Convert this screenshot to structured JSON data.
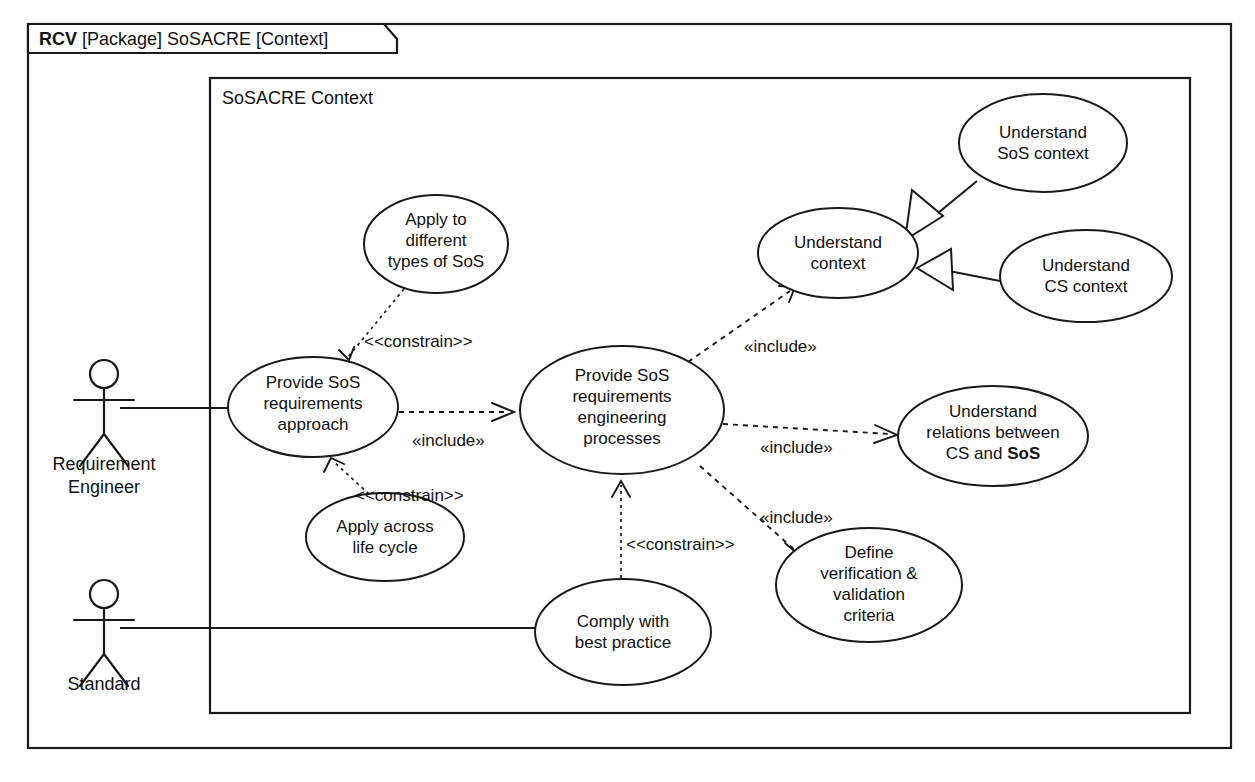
{
  "frame": {
    "kind": "RCV",
    "rest": " [Package] SoSACRE [Context]",
    "full_title": "RCV [Package] SoSACRE [Context]"
  },
  "inner_box": {
    "label": "SoSACRE Context"
  },
  "actors": [
    {
      "id": "requirement-engineer",
      "name_lines": [
        "Requirement",
        "Engineer"
      ],
      "cx": 104,
      "head_cy": 374,
      "label_y1": 470,
      "label_y2": 493
    },
    {
      "id": "standard",
      "name_lines": [
        "Standard"
      ],
      "cx": 104,
      "head_cy": 594,
      "label_y1": 690,
      "label_y2": null
    }
  ],
  "use_cases": [
    {
      "id": "apply-different-types-sos",
      "lines": [
        "Apply to",
        "different",
        "types of SoS"
      ],
      "cx": 436,
      "cy": 244,
      "rx": 72,
      "ry": 49
    },
    {
      "id": "understand-context",
      "lines": [
        "Understand",
        "context"
      ],
      "cx": 838,
      "cy": 253,
      "rx": 80,
      "ry": 45
    },
    {
      "id": "understand-sos-context",
      "lines": [
        "Understand",
        "SoS context"
      ],
      "cx": 1043,
      "cy": 143,
      "rx": 84,
      "ry": 49
    },
    {
      "id": "understand-cs-context",
      "lines": [
        "Understand",
        "CS context"
      ],
      "cx": 1086,
      "cy": 276,
      "rx": 86,
      "ry": 46
    },
    {
      "id": "provide-sos-requirements-approach",
      "lines": [
        "Provide SoS",
        "requirements",
        "approach"
      ],
      "cx": 313,
      "cy": 407,
      "rx": 85,
      "ry": 50
    },
    {
      "id": "provide-sos-re-processes",
      "lines": [
        "Provide SoS",
        "requirements",
        "engineering",
        "processes"
      ],
      "cx": 622,
      "cy": 410,
      "rx": 102,
      "ry": 64
    },
    {
      "id": "understand-relations-cs-sos",
      "lines": [
        "Understand",
        "relations between",
        "CS and SoS"
      ],
      "cx": 993,
      "cy": 436,
      "rx": 95,
      "ry": 50,
      "bold_tokens": [
        "SoS"
      ]
    },
    {
      "id": "define-verification-validation-criteria",
      "lines": [
        "Define",
        "verification &",
        "validation",
        "criteria"
      ],
      "cx": 869,
      "cy": 585,
      "rx": 93,
      "ry": 57
    },
    {
      "id": "apply-across-life-cycle",
      "lines": [
        "Apply across",
        "life cycle"
      ],
      "cx": 385,
      "cy": 537,
      "rx": 79,
      "ry": 44
    },
    {
      "id": "comply-with-best-practice",
      "lines": [
        "Comply with",
        "best practice"
      ],
      "cx": 623,
      "cy": 632,
      "rx": 88,
      "ry": 53
    }
  ],
  "relationship_labels": [
    {
      "id": "constrain-top",
      "text": "<<constrain>>",
      "x": 364,
      "y": 347
    },
    {
      "id": "include-approach-to-processes",
      "text": "«include»",
      "x": 412,
      "y": 446
    },
    {
      "id": "include-understand-context",
      "text": "«include»",
      "x": 744,
      "y": 352
    },
    {
      "id": "include-understand-relations",
      "text": "«include»",
      "x": 760,
      "y": 453
    },
    {
      "id": "include-define-vv",
      "text": "«include»",
      "x": 760,
      "y": 523
    },
    {
      "id": "constrain-bottom-left",
      "text": "<<constrain>>",
      "x": 355,
      "y": 501
    },
    {
      "id": "constrain-bottom-center",
      "text": "<<constrain>>",
      "x": 626,
      "y": 550
    }
  ]
}
